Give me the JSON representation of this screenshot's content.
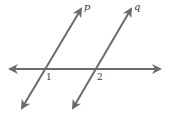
{
  "diagram": {
    "line_color": "#6b6b6b",
    "text_color": "#3a3a3a",
    "lines": [
      {
        "id": "p",
        "label": "p",
        "x1": 22,
        "y1": 108,
        "x2": 81,
        "y2": 9
      },
      {
        "id": "q",
        "label": "q",
        "x1": 73,
        "y1": 108,
        "x2": 131,
        "y2": 9
      },
      {
        "id": "transversal",
        "label": "",
        "x1": 10,
        "y1": 69,
        "x2": 160,
        "y2": 69
      }
    ],
    "angle_labels": [
      {
        "id": "angle-1",
        "text": "1",
        "x": 46,
        "y": 80
      },
      {
        "id": "angle-2",
        "text": "2",
        "x": 97,
        "y": 80
      }
    ],
    "line_labels": {
      "p": {
        "text": "p",
        "x": 84,
        "y": 10
      },
      "q": {
        "text": "q",
        "x": 134,
        "y": 10
      }
    }
  }
}
